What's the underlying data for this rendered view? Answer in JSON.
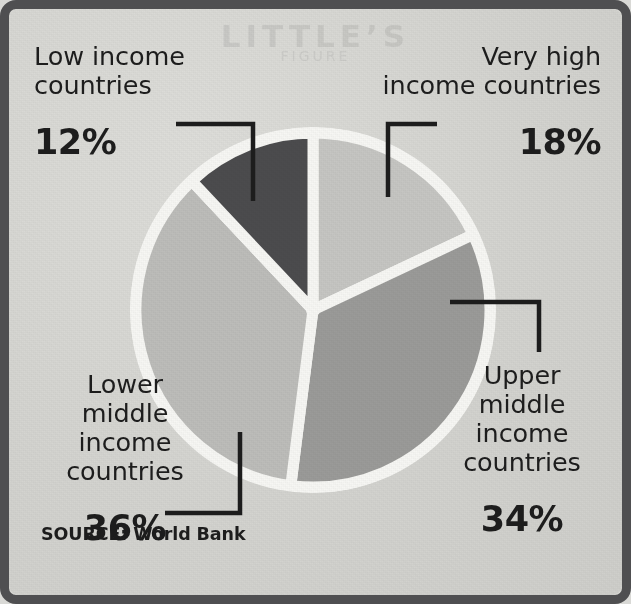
{
  "figure": {
    "source_label": "SOURCE: World Bank",
    "ghost_text": "LITTLE’S",
    "ghost_text_2": "FIGURE",
    "frame_color": "#4f4f51",
    "paper_color": "#d6d6d2",
    "text_color": "#1d1d1d",
    "gap_color": "#f7f7f4"
  },
  "chart_data": {
    "type": "pie",
    "title": "",
    "subtitle": "",
    "xlabel": "",
    "ylabel": "",
    "legend_position": "callout-labels",
    "grid": false,
    "source": "SOURCE: World Bank",
    "units": "percent",
    "total": 100,
    "start_angle_deg": 0,
    "direction": "clockwise",
    "categories": [
      "Very high income countries",
      "Upper middle income countries",
      "Lower middle income countries",
      "Low income countries"
    ],
    "values": [
      18,
      34,
      36,
      12
    ],
    "value_labels": [
      "18%",
      "34%",
      "36%",
      "12%"
    ],
    "colors": [
      "#c6c6c3",
      "#9b9b99",
      "#bdbdba",
      "#4c4c4e"
    ],
    "slices": [
      {
        "name": "Very high income countries",
        "label_lines": "Very high\ninecome countries",
        "value": 18,
        "value_label": "18%",
        "color": "#c6c6c3",
        "start_deg": 0,
        "end_deg": 64.8
      },
      {
        "name": "Upper middle income countries",
        "label_lines": "Upper\nmiddle\nincome\ncountries",
        "value": 34,
        "value_label": "34%",
        "color": "#9b9b99",
        "start_deg": 64.8,
        "end_deg": 187.2
      },
      {
        "name": "Lower middle income countries",
        "label_lines": "Lower\nmiddle\nincome\ncountries",
        "value": 36,
        "value_label": "36%",
        "color": "#bdbdba",
        "start_deg": 187.2,
        "end_deg": 316.8
      },
      {
        "name": "Low income countries",
        "label_lines": "Low income\ncountries",
        "value": 12,
        "value_label": "12%",
        "color": "#4c4c4e",
        "start_deg": 316.8,
        "end_deg": 360
      }
    ]
  },
  "labels": {
    "low_income": {
      "name": "Low income\ncountries",
      "percent": "12%"
    },
    "very_high_income": {
      "name": "Very high\nincome countries",
      "percent": "18%"
    },
    "lower_middle_income": {
      "name": "Lower\nmiddle\nincome\ncountries",
      "percent": "36%"
    },
    "upper_middle_income": {
      "name": "Upper\nmiddle\nincome\ncountries",
      "percent": "34%"
    }
  }
}
